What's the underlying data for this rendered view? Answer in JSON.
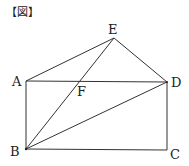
{
  "header": {
    "label": "【図】"
  },
  "diagram": {
    "points": {
      "A": {
        "label": "A"
      },
      "B": {
        "label": "B"
      },
      "C": {
        "label": "C"
      },
      "D": {
        "label": "D"
      },
      "E": {
        "label": "E"
      },
      "F": {
        "label": "F"
      }
    },
    "segments": [
      [
        "A",
        "B"
      ],
      [
        "B",
        "C"
      ],
      [
        "C",
        "D"
      ],
      [
        "D",
        "A"
      ],
      [
        "A",
        "E"
      ],
      [
        "E",
        "D"
      ],
      [
        "B",
        "E"
      ],
      [
        "B",
        "D"
      ]
    ],
    "intersection": {
      "point": "F",
      "of": [
        [
          "A",
          "D"
        ],
        [
          "B",
          "E"
        ]
      ]
    },
    "line_color": "#333333"
  }
}
